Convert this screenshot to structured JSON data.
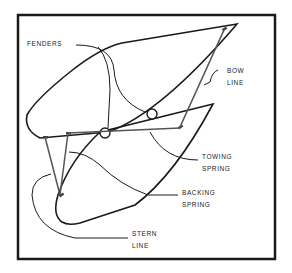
{
  "diagram": {
    "labels": {
      "fenders": "FENDERS",
      "bow_line_1": "BOW",
      "bow_line_2": "LINE",
      "towing_spring_1": "TOWING",
      "towing_spring_2": "SPRING",
      "backing_spring_1": "BACKING",
      "backing_spring_2": "SPRING",
      "stern_line_1": "STERN",
      "stern_line_2": "LINE"
    },
    "colors": {
      "ink": "#1a1a1a",
      "line_rope": "#555555",
      "background": "#ffffff"
    }
  }
}
